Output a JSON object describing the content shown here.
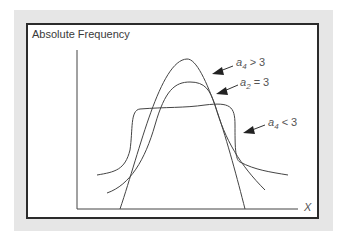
{
  "figure": {
    "y_axis_title": "Absolute Frequency",
    "x_axis_title": "X",
    "colors": {
      "backdrop": "#e6e6e6",
      "frame": "#2b2b2b",
      "curve": "#444444",
      "label": "#555555"
    }
  },
  "annotations": [
    {
      "var": "a",
      "sub": "4",
      "rel": " > 3",
      "kind": "leptokurtic"
    },
    {
      "var": "a",
      "sub": "2",
      "rel": " = 3",
      "kind": "mesokurtic"
    },
    {
      "var": "a",
      "sub": "4",
      "rel": " < 3",
      "kind": "platykurtic"
    }
  ],
  "curves": [
    {
      "name": "leptokurtic",
      "label": "a4 > 3"
    },
    {
      "name": "mesokurtic",
      "label": "a2 = 3"
    },
    {
      "name": "platykurtic",
      "label": "a4 < 3"
    }
  ]
}
